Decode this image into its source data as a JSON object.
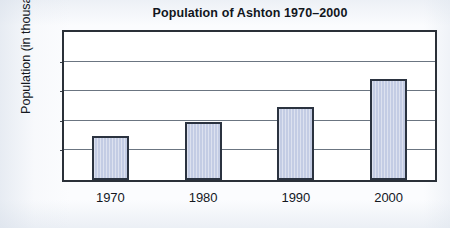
{
  "chart_data": {
    "type": "bar",
    "title": "Population of Ashton 1970–2000",
    "xlabel": "",
    "ylabel": "Population (in thousands)",
    "categories": [
      "1970",
      "1980",
      "1990",
      "2000"
    ],
    "values": [
      3.0,
      3.9,
      4.9,
      6.8
    ],
    "ylim": [
      0,
      10
    ],
    "ytick_labels": [
      "0",
      "2",
      "4",
      "6",
      "8",
      "10"
    ],
    "ytick_values": [
      0,
      2,
      4,
      6,
      8,
      10
    ],
    "grid": "horizontal",
    "legend": null,
    "bar_fill_color": "#c3cce4",
    "bar_edge_color": "#2b3340",
    "axis_color": "#2a3038",
    "gridline_color": "#6b7581",
    "plot_background": "#ffffff",
    "page_background": "#fbfcfe"
  }
}
